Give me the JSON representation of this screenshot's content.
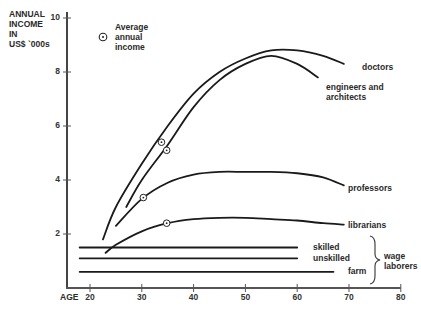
{
  "chart_data": {
    "type": "line",
    "title": "",
    "ylabel": "ANNUAL INCOME IN US$ '000s",
    "ylabel_lines": [
      "ANNUAL",
      "INCOME",
      "IN",
      "US$ `000s"
    ],
    "xlabel": "AGE",
    "xlim": [
      20,
      80
    ],
    "ylim": [
      0,
      10
    ],
    "x_ticks": [
      20,
      30,
      40,
      50,
      60,
      70,
      80
    ],
    "y_ticks": [
      2,
      4,
      6,
      8,
      10
    ],
    "grid": false,
    "legend": {
      "marker": "circled-dot",
      "lines": [
        "Average",
        "annual",
        "income"
      ],
      "position": "upper-left"
    },
    "series": [
      {
        "name": "doctors",
        "x": [
          22.5,
          25,
          30,
          35,
          40,
          45,
          50,
          55,
          60,
          65,
          69
        ],
        "y": [
          1.8,
          3.0,
          4.6,
          6.0,
          7.2,
          8.0,
          8.5,
          8.8,
          8.8,
          8.6,
          8.3
        ],
        "average": {
          "x": 33.8,
          "y": 5.4
        }
      },
      {
        "name": "engineers and architects",
        "x": [
          27,
          30,
          35,
          40,
          45,
          50,
          55,
          60,
          64
        ],
        "y": [
          3.0,
          4.0,
          5.3,
          6.7,
          7.7,
          8.3,
          8.6,
          8.3,
          7.8
        ],
        "average": {
          "x": 34.8,
          "y": 5.1
        }
      },
      {
        "name": "professors",
        "x": [
          25,
          30,
          35,
          40,
          45,
          50,
          55,
          60,
          65,
          69
        ],
        "y": [
          2.3,
          3.3,
          3.9,
          4.2,
          4.3,
          4.3,
          4.3,
          4.25,
          4.1,
          3.8
        ],
        "average": {
          "x": 30.3,
          "y": 3.35
        }
      },
      {
        "name": "librarians",
        "x": [
          23,
          25,
          30,
          35,
          40,
          45,
          50,
          55,
          60,
          65,
          69
        ],
        "y": [
          1.3,
          1.6,
          2.1,
          2.4,
          2.55,
          2.6,
          2.6,
          2.55,
          2.5,
          2.4,
          2.35
        ],
        "average": {
          "x": 34.8,
          "y": 2.4
        }
      },
      {
        "name": "skilled",
        "group": "wage laborers",
        "x": [
          18,
          60
        ],
        "y": [
          1.5,
          1.5
        ]
      },
      {
        "name": "unskilled",
        "group": "wage laborers",
        "x": [
          18,
          60
        ],
        "y": [
          1.1,
          1.1
        ]
      },
      {
        "name": "farm",
        "group": "wage laborers",
        "x": [
          18,
          67
        ],
        "y": [
          0.6,
          0.6
        ]
      }
    ],
    "annotations": [
      {
        "text": "wage laborers",
        "type": "brace",
        "applies_to": [
          "skilled",
          "unskilled",
          "farm"
        ]
      }
    ]
  },
  "labels": {
    "doctors": "doctors",
    "engineers_1": "engineers and",
    "engineers_2": "architects",
    "professors": "professors",
    "librarians": "librarians",
    "skilled": "skilled",
    "unskilled": "unskilled",
    "farm": "farm",
    "wage_1": "wage",
    "wage_2": "laborers"
  }
}
